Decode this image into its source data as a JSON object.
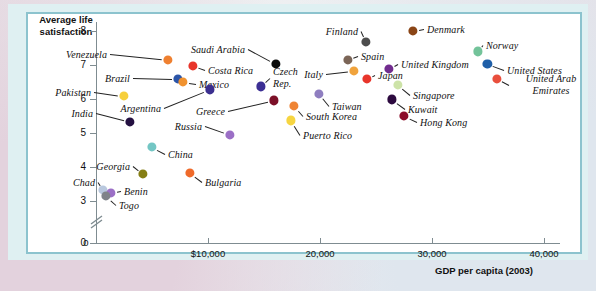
{
  "chart_data": {
    "type": "scatter",
    "title": "",
    "ylabel": "Average life satisfaction",
    "xlabel": "GDP per capita (2003)",
    "xlim": [
      0,
      44000
    ],
    "ylim": [
      2.6,
      8.4
    ],
    "grid": false,
    "legend": "none",
    "yticks": [
      "8",
      "7",
      "6",
      "5",
      "4",
      "3",
      "0"
    ],
    "ytick_values": [
      8,
      7,
      6,
      5,
      4,
      3,
      0
    ],
    "y_axis_break": true,
    "xticks": [
      "0",
      "$10,000",
      "20,000",
      "30,000",
      "40,000"
    ],
    "xtick_values": [
      0,
      10000,
      20000,
      30000,
      40000
    ],
    "points": [
      {
        "label": "Venezuela",
        "x": 6400,
        "y": 7.15,
        "color": "#ef8030",
        "lx": 110,
        "ly": 54,
        "anchor": "l",
        "leader": true
      },
      {
        "label": "Costa Rica",
        "x": 8650,
        "y": 6.98,
        "color": "#e8352b",
        "lx": 205,
        "ly": 70,
        "anchor": "l",
        "leader": true
      },
      {
        "label": "Brazil",
        "x": 7300,
        "y": 6.58,
        "color": "#2b55a8",
        "lx": 133,
        "ly": 78,
        "anchor": "l",
        "leader": true
      },
      {
        "label": "Mexico",
        "x": 7750,
        "y": 6.5,
        "color": "#f0922f",
        "lx": 196,
        "ly": 84,
        "anchor": "l",
        "leader": true
      },
      {
        "label": "Pakistan",
        "x": 2500,
        "y": 6.08,
        "color": "#f6cf3c",
        "lx": 94,
        "ly": 92,
        "anchor": "l",
        "leader": true
      },
      {
        "label": "Argentina",
        "x": 10150,
        "y": 6.28,
        "color": "#3b2f8f",
        "lx": 164,
        "ly": 108,
        "anchor": "l",
        "leader": true
      },
      {
        "label": "India",
        "x": 3050,
        "y": 5.33,
        "color": "#241041",
        "lx": 96,
        "ly": 113,
        "anchor": "l",
        "leader": true
      },
      {
        "label": "Russia",
        "x": 11950,
        "y": 4.95,
        "color": "#9b6fc6",
        "lx": 205,
        "ly": 126,
        "anchor": "l",
        "leader": true
      },
      {
        "label": "Saudi Arabia",
        "x": 16050,
        "y": 7.03,
        "color": "#0b0b0b",
        "lx": 248,
        "ly": 49,
        "anchor": "l",
        "leader": true
      },
      {
        "label": "Czech Rep.",
        "x": 14700,
        "y": 6.37,
        "color": "#3c2f94",
        "lx": 270,
        "ly": 78,
        "anchor": "l",
        "leader": true
      },
      {
        "label": "Greece",
        "x": 15900,
        "y": 5.96,
        "color": "#7c1028",
        "lx": 228,
        "ly": 111,
        "anchor": "l",
        "leader": true
      },
      {
        "label": "South Korea",
        "x": 17700,
        "y": 5.79,
        "color": "#ef8434",
        "lx": 303,
        "ly": 116,
        "anchor": "l",
        "leader": true
      },
      {
        "label": "Puerto Rico",
        "x": 17400,
        "y": 5.37,
        "color": "#f6d541",
        "lx": 300,
        "ly": 135,
        "anchor": "l",
        "leader": true
      },
      {
        "label": "Taiwan",
        "x": 19900,
        "y": 6.16,
        "color": "#8f7ec0",
        "lx": 329,
        "ly": 106,
        "anchor": "l",
        "leader": true
      },
      {
        "label": "Finland",
        "x": 24100,
        "y": 7.69,
        "color": "#4d4d4d",
        "lx": 361,
        "ly": 31,
        "anchor": "l",
        "leader": true
      },
      {
        "label": "Spain",
        "x": 22500,
        "y": 7.15,
        "color": "#7b6557",
        "lx": 358,
        "ly": 56,
        "anchor": "l",
        "leader": true
      },
      {
        "label": "Italy",
        "x": 23050,
        "y": 6.83,
        "color": "#f0a33c",
        "lx": 326,
        "ly": 74,
        "anchor": "l",
        "leader": true
      },
      {
        "label": "Japan",
        "x": 24200,
        "y": 6.59,
        "color": "#e8352b",
        "lx": 375,
        "ly": 75,
        "anchor": "l",
        "leader": true
      },
      {
        "label": "United Kingdom",
        "x": 26150,
        "y": 6.88,
        "color": "#712c8e",
        "lx": 398,
        "ly": 64,
        "anchor": "l",
        "leader": true
      },
      {
        "label": "Singapore",
        "x": 26950,
        "y": 6.41,
        "color": "#cde3a8",
        "lx": 410,
        "ly": 95,
        "anchor": "l",
        "leader": true
      },
      {
        "label": "Kuwait",
        "x": 26400,
        "y": 5.99,
        "color": "#2d0a3f",
        "lx": 405,
        "ly": 109,
        "anchor": "l",
        "leader": true
      },
      {
        "label": "Hong Kong",
        "x": 27500,
        "y": 5.5,
        "color": "#8c0d2a",
        "lx": 417,
        "ly": 122,
        "anchor": "l",
        "leader": true
      },
      {
        "label": "Denmark",
        "x": 28300,
        "y": 8.0,
        "color": "#8a4516",
        "lx": 424,
        "ly": 29,
        "anchor": "l",
        "leader": true
      },
      {
        "label": "Norway",
        "x": 34100,
        "y": 7.4,
        "color": "#73c39a",
        "lx": 483,
        "ly": 45,
        "anchor": "l",
        "leader": true
      },
      {
        "label": "United States",
        "x": 34950,
        "y": 7.03,
        "color": "#1f5fa8",
        "lx": 504,
        "ly": 70,
        "anchor": "l",
        "leader": true
      },
      {
        "label": "United Arab Emirates",
        "x": 35800,
        "y": 6.6,
        "color": "#e94f3d",
        "lx": 509,
        "ly": 85,
        "anchor": "l",
        "leader": true
      },
      {
        "label": "China",
        "x": 5000,
        "y": 4.58,
        "color": "#73c6c4",
        "lx": 165,
        "ly": 154,
        "anchor": "l",
        "leader": true
      },
      {
        "label": "Georgia",
        "x": 4200,
        "y": 3.79,
        "color": "#857e14",
        "lx": 133,
        "ly": 166,
        "anchor": "l",
        "leader": true
      },
      {
        "label": "Bulgaria",
        "x": 8400,
        "y": 3.82,
        "color": "#ef6a2a",
        "lx": 202,
        "ly": 182,
        "anchor": "l",
        "leader": true
      },
      {
        "label": "Chad",
        "x": 650,
        "y": 3.32,
        "color": "#b9c8de",
        "lx": 98,
        "ly": 182,
        "anchor": "l",
        "leader": true
      },
      {
        "label": "Benin",
        "x": 1350,
        "y": 3.24,
        "color": "#9b6fc6",
        "lx": 121,
        "ly": 191,
        "anchor": "l",
        "leader": true
      },
      {
        "label": "Togo",
        "x": 900,
        "y": 3.14,
        "color": "#7f8389",
        "lx": 116,
        "ly": 205,
        "anchor": "l",
        "leader": true
      }
    ]
  }
}
